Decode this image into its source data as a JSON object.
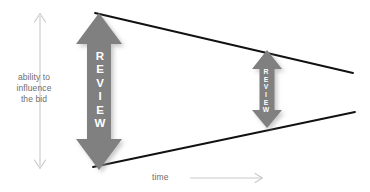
{
  "diagram": {
    "background_color": "#ffffff",
    "y_axis": {
      "label": "ability to\ninfluence\nthe bid",
      "color": "#c9c9c9",
      "text_color": "#6e6e6e"
    },
    "x_axis": {
      "label": "time",
      "color": "#c9c9c9",
      "text_color": "#6e6e6e"
    },
    "cone": {
      "color": "#111111",
      "upper_line": {
        "x1": 95,
        "y1": 13,
        "x2": 353,
        "y2": 73
      },
      "lower_line": {
        "x1": 93,
        "y1": 167,
        "x2": 355,
        "y2": 112
      }
    },
    "arrows": [
      {
        "name": "review-arrow-primary",
        "label": "REVIEW",
        "letters": [
          "R",
          "E",
          "V",
          "I",
          "E",
          "W"
        ],
        "color": "#808080",
        "text_color": "#ffffff",
        "top": 13,
        "bottom": 170,
        "left": 76,
        "right": 122
      },
      {
        "name": "review-arrow-secondary",
        "label": "REVIEW",
        "letters": [
          "R",
          "E",
          "V",
          "I",
          "E",
          "W"
        ],
        "color": "#808080",
        "text_color": "#ffffff",
        "top": 50,
        "bottom": 128,
        "left": 252,
        "right": 282
      }
    ]
  }
}
